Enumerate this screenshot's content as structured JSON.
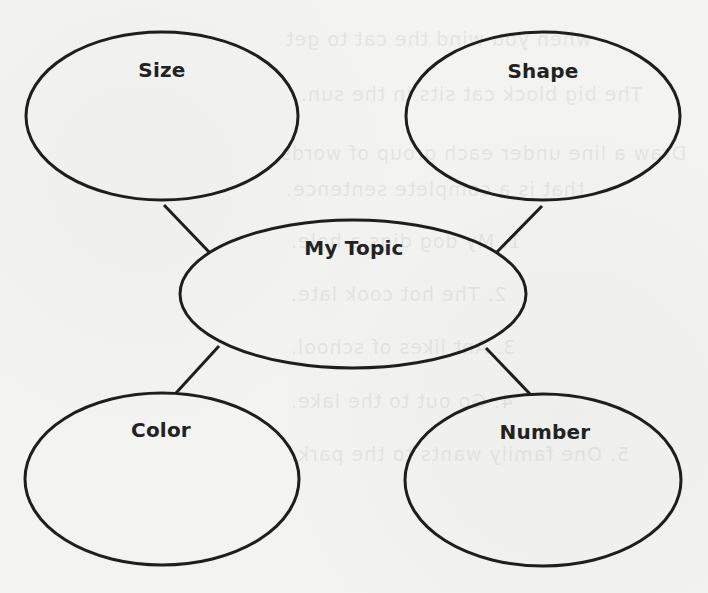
{
  "diagram": {
    "type": "concept-web",
    "stroke_color": "#1e1e1e",
    "background_color": "#f3f3f1",
    "center": {
      "label": "My Topic"
    },
    "nodes": [
      {
        "id": "size",
        "label": "Size"
      },
      {
        "id": "shape",
        "label": "Shape"
      },
      {
        "id": "color",
        "label": "Color"
      },
      {
        "id": "number",
        "label": "Number"
      }
    ],
    "connections": [
      {
        "from": "my-topic",
        "to": "size"
      },
      {
        "from": "my-topic",
        "to": "shape"
      },
      {
        "from": "my-topic",
        "to": "color"
      },
      {
        "from": "my-topic",
        "to": "number"
      }
    ]
  },
  "bleed_through": {
    "lines": [
      "when you wind the cat to get",
      "The big block cat sits in the sun.",
      "Draw a line under each group of words",
      "that is a complete sentence.",
      "1. My dog digs a hole.",
      "2. The hot cook late.",
      "3. Ant likes of school.",
      "4. Go out to the lake.",
      "5. One family wants to the park."
    ]
  }
}
